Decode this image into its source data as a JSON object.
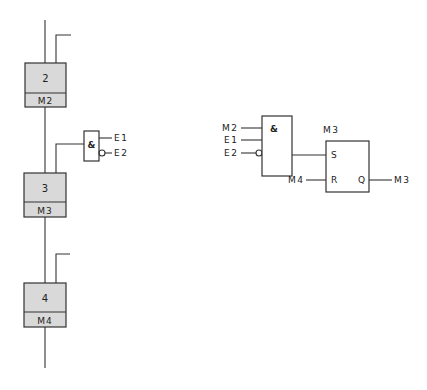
{
  "colors": {
    "line": "#333333",
    "step_fill": "#d9d9d9",
    "background": "#ffffff"
  },
  "sequence": {
    "steps": [
      {
        "number": "2",
        "action": "M2"
      },
      {
        "number": "3",
        "action": "M3"
      },
      {
        "number": "4",
        "action": "M4"
      }
    ],
    "transition_gate": {
      "symbol": "&",
      "inputs": [
        {
          "label": "E1",
          "inverted": false
        },
        {
          "label": "E2",
          "inverted": true
        }
      ]
    }
  },
  "logic": {
    "and_gate": {
      "symbol": "&",
      "inputs": [
        {
          "label": "M2",
          "inverted": false
        },
        {
          "label": "E1",
          "inverted": false
        },
        {
          "label": "E2",
          "inverted": true
        }
      ]
    },
    "flipflop": {
      "title": "M3",
      "set_pin": "S",
      "reset_pin": "R",
      "output_pin": "Q",
      "reset_input": "M4",
      "output_label": "M3"
    }
  }
}
